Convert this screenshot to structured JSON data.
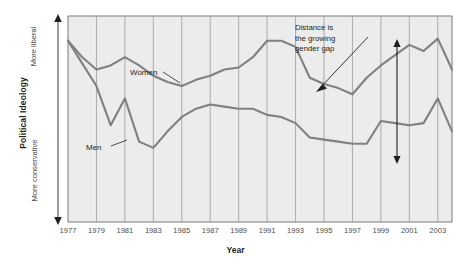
{
  "chart_data": {
    "type": "line",
    "title": "",
    "xlabel": "Year",
    "ylabel": "Political Ideology",
    "grid": true,
    "legend_position": "inline-labels",
    "xlim": [
      1977,
      2004
    ],
    "ylim": [
      0,
      100
    ],
    "y_axis_note": "Unlabeled ordinal scale; axis arrow points up toward 'More liberal' and down toward 'More conservative'",
    "x_tick_labels": [
      "1977",
      "1979",
      "1981",
      "1983",
      "1985",
      "1987",
      "1989",
      "1991",
      "1993",
      "1995",
      "1997",
      "1999",
      "2001",
      "2003"
    ],
    "x_tick_values": [
      1977,
      1979,
      1981,
      1983,
      1985,
      1987,
      1989,
      1991,
      1993,
      1995,
      1997,
      1999,
      2001,
      2003
    ],
    "y_axis_top_label": "More liberal",
    "y_axis_bottom_label": "More conservative",
    "annotations": [
      {
        "name": "gender-gap-annotation",
        "text": "Distance is the growing gender gap",
        "lines": [
          "Distance is",
          "the growing",
          "gender gap"
        ],
        "pointer": "diagonal arrow from text down-right to the double-headed gap arrow",
        "gap_marker_year": 2000
      }
    ],
    "x": [
      1977,
      1978,
      1979,
      1980,
      1981,
      1982,
      1983,
      1984,
      1985,
      1986,
      1987,
      1988,
      1989,
      1990,
      1991,
      1992,
      1993,
      1994,
      1995,
      1996,
      1997,
      1998,
      1999,
      2000,
      2001,
      2002,
      2003,
      2004
    ],
    "series": [
      {
        "name": "Women",
        "color": "#808080",
        "values": [
          88,
          80,
          74,
          76,
          80,
          76,
          71,
          68,
          66,
          69,
          71,
          74,
          75,
          80,
          88,
          88,
          85,
          70,
          67,
          65,
          62,
          70,
          76,
          81,
          86,
          83,
          89,
          74
        ]
      },
      {
        "name": "Men",
        "color": "#808080",
        "values": [
          88,
          77,
          66,
          47,
          60,
          39,
          36,
          44,
          51,
          55,
          57,
          56,
          55,
          55,
          52,
          51,
          48,
          41,
          40,
          39,
          38,
          38,
          49,
          48,
          47,
          48,
          60,
          44
        ]
      }
    ]
  },
  "labels": {
    "women": "Women",
    "men": "Men"
  }
}
